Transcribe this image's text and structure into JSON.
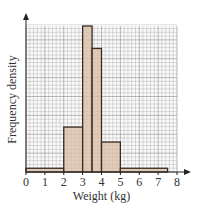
{
  "chart_data": {
    "type": "bar",
    "subtype": "histogram",
    "title": "",
    "xlabel": "Weight (kg)",
    "ylabel": "Frequency density",
    "x_ticks": [
      "0",
      "1",
      "2",
      "3",
      "4",
      "5",
      "6",
      "7",
      "8"
    ],
    "xlim": [
      0,
      8
    ],
    "y_ticks": [],
    "ylim_grid_squares": [
      0,
      39
    ],
    "grid": true,
    "grid_minor_x": 0.2,
    "legend": null,
    "bins": [
      {
        "from": 0,
        "to": 2,
        "height": 1
      },
      {
        "from": 2,
        "to": 3,
        "height": 12
      },
      {
        "from": 3,
        "to": 3.5,
        "height": 39
      },
      {
        "from": 3.5,
        "to": 4,
        "height": 33
      },
      {
        "from": 4,
        "to": 5,
        "height": 8
      },
      {
        "from": 5,
        "to": 7.5,
        "height": 1
      }
    ],
    "categories": [
      "0-2",
      "2-3",
      "3-3.5",
      "3.5-4",
      "4-5",
      "5-7.5"
    ],
    "values": [
      1,
      12,
      39,
      33,
      8,
      1
    ],
    "height_units": "small grid squares (relative frequency density)",
    "colors": {
      "bar_fill": "#d9bfa6",
      "bar_edge": "#3a2a20",
      "grid": "#9a9a9a",
      "axis": "#222222"
    }
  }
}
